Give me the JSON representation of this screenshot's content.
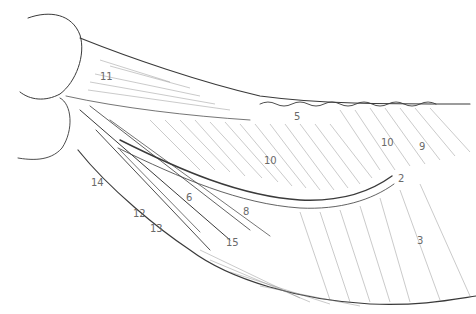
{
  "figure": {
    "type": "anatomical-line-drawing",
    "colors": {
      "background": "#ffffff",
      "ink": "#3a3a3a",
      "label": "#6a6a6a"
    }
  },
  "labels": [
    {
      "id": "l11",
      "text": "11",
      "x": 100,
      "y": 72
    },
    {
      "id": "l5",
      "text": "5",
      "x": 294,
      "y": 112
    },
    {
      "id": "l10a",
      "text": "10",
      "x": 264,
      "y": 156
    },
    {
      "id": "l10b",
      "text": "10",
      "x": 381,
      "y": 138
    },
    {
      "id": "l9",
      "text": "9",
      "x": 419,
      "y": 142
    },
    {
      "id": "l2",
      "text": "2",
      "x": 398,
      "y": 174
    },
    {
      "id": "l3",
      "text": "3",
      "x": 417,
      "y": 236
    },
    {
      "id": "l14",
      "text": "14",
      "x": 91,
      "y": 178
    },
    {
      "id": "l12",
      "text": "12",
      "x": 133,
      "y": 209
    },
    {
      "id": "l13",
      "text": "13",
      "x": 150,
      "y": 224
    },
    {
      "id": "l6",
      "text": "6",
      "x": 186,
      "y": 193
    },
    {
      "id": "l8",
      "text": "8",
      "x": 243,
      "y": 207
    },
    {
      "id": "l15",
      "text": "15",
      "x": 226,
      "y": 238
    }
  ]
}
